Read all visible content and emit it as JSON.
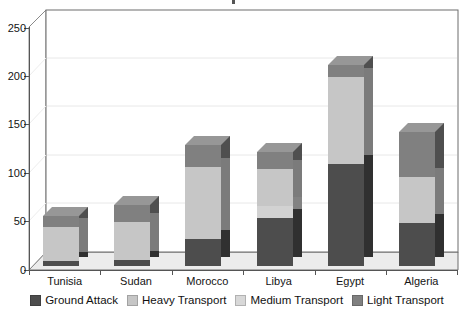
{
  "chart_data": {
    "type": "bar",
    "subtype": "stacked-3d-column",
    "title": "",
    "xlabel": "",
    "ylabel": "",
    "ylim": [
      0,
      250
    ],
    "yticks": [
      0,
      50,
      100,
      150,
      200,
      250
    ],
    "grid": true,
    "legend_position": "bottom",
    "categories": [
      "Tunisia",
      "Sudan",
      "Morocco",
      "Libya",
      "Egypt",
      "Algeria"
    ],
    "series": [
      {
        "name": "Ground Attack",
        "color": "#4d4d4d",
        "values": [
          5,
          6,
          28,
          50,
          105,
          44
        ]
      },
      {
        "name": "Medium Transport",
        "color": "#d2d2d2",
        "values": [
          0,
          0,
          0,
          12,
          0,
          0
        ]
      },
      {
        "name": "Heavy Transport",
        "color": "#c6c6c6",
        "values": [
          35,
          39,
          74,
          38,
          90,
          48
        ]
      },
      {
        "name": "Light Transport",
        "color": "#808080",
        "values": [
          12,
          18,
          23,
          18,
          13,
          46
        ]
      }
    ],
    "totals": [
      52,
      63,
      125,
      118,
      208,
      138
    ]
  },
  "axis": {
    "y_tick_labels": [
      "250",
      "200",
      "150",
      "100",
      "50",
      "0"
    ]
  },
  "legend": {
    "items": [
      {
        "label": "Ground Attack",
        "color": "#4d4d4d",
        "icon": "legend-swatch-icon"
      },
      {
        "label": "Heavy Transport",
        "color": "#c6c6c6",
        "icon": "legend-swatch-icon"
      },
      {
        "label": "Medium Transport",
        "color": "#d8d8d8",
        "icon": "legend-swatch-icon"
      },
      {
        "label": "Light Transport",
        "color": "#808080",
        "icon": "legend-swatch-icon"
      }
    ]
  },
  "colors": {
    "ground_attack": "#4d4d4d",
    "heavy_transport": "#c6c6c6",
    "medium_transport": "#d8d8d8",
    "light_transport": "#808080",
    "plot_border": "#6d6d6d",
    "gridline": "#e3e3e3",
    "floor": "#ececec",
    "background": "#ffffff"
  }
}
